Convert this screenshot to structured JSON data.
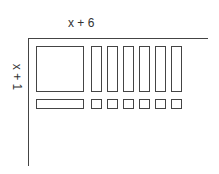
{
  "labels": {
    "top": "x + 6",
    "side": "x + 1"
  },
  "tiles": {
    "x_squared": 1,
    "x_rods_vertical": 6,
    "x_rod_horizontal": 1,
    "unit_squares": 6
  },
  "colors": {
    "stroke": "#444444",
    "background": "#ffffff"
  }
}
